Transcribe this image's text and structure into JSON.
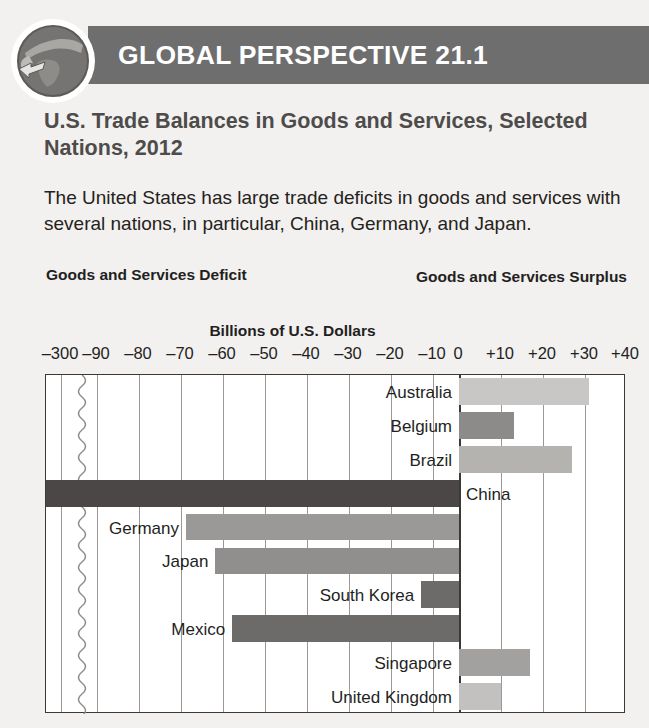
{
  "banner": {
    "title": "GLOBAL PERSPECTIVE 21.1",
    "icon": "globe-arrow-icon",
    "bar_color": "#6e6e6e"
  },
  "headline": "U.S. Trade Balances in Goods and Services, Selected Nations, 2012",
  "blurb": "The United States has large trade deficits in goods and services with several nations, in particular, China, Germany, and Japan.",
  "captions": {
    "deficit": "Goods and Services Deficit",
    "surplus": "Goods and Services Surplus"
  },
  "chart_data": {
    "type": "bar",
    "orientation": "horizontal",
    "title": "U.S. Trade Balances in Goods and Services, Selected Nations, 2012",
    "xlabel": "Billions of U.S. Dollars",
    "ylabel": "",
    "grid": true,
    "legend": false,
    "axis_break": {
      "between": [
        -300,
        -90
      ],
      "marker": "squiggle"
    },
    "xlim": [
      -300,
      40
    ],
    "tick_labels": [
      "–300",
      "–90",
      "–80",
      "–70",
      "–60",
      "–50",
      "–40",
      "–30",
      "–20",
      "–10",
      "0",
      "+10",
      "+20",
      "+30",
      "+40"
    ],
    "tick_values": [
      -300,
      -90,
      -80,
      -70,
      -60,
      -50,
      -40,
      -30,
      -20,
      -10,
      0,
      10,
      20,
      30,
      40
    ],
    "tick_px": [
      60,
      96,
      138,
      180,
      222,
      264,
      306,
      348,
      390,
      432,
      458,
      500,
      542,
      584,
      625
    ],
    "categories": [
      "Australia",
      "Belgium",
      "Brazil",
      "China",
      "Germany",
      "Japan",
      "South Korea",
      "Mexico",
      "Singapore",
      "United Kingdom"
    ],
    "values": [
      31,
      13,
      27,
      -315,
      -65,
      -58,
      -9,
      -54,
      17,
      10
    ],
    "bars": [
      {
        "label": "Australia",
        "value": 31,
        "color": "#c8c7c5",
        "label_side": "left",
        "clipped": false
      },
      {
        "label": "Belgium",
        "value": 13,
        "color": "#8d8b89",
        "label_side": "left",
        "clipped": false
      },
      {
        "label": "Brazil",
        "value": 27,
        "color": "#b4b3b0",
        "label_side": "left",
        "clipped": false
      },
      {
        "label": "China",
        "value": -315,
        "color": "#4a4746",
        "label_side": "right",
        "clipped": true
      },
      {
        "label": "Germany",
        "value": -65,
        "color": "#9b9997",
        "label_side": "left",
        "clipped": false
      },
      {
        "label": "Japan",
        "value": -58,
        "color": "#918f8d",
        "label_side": "left",
        "clipped": false
      },
      {
        "label": "South Korea",
        "value": -9,
        "color": "#6d6b69",
        "label_side": "left",
        "clipped": false
      },
      {
        "label": "Mexico",
        "value": -54,
        "color": "#6d6b69",
        "label_side": "left",
        "clipped": false
      },
      {
        "label": "Singapore",
        "value": 17,
        "color": "#a3a19f",
        "label_side": "left",
        "clipped": false
      },
      {
        "label": "United Kingdom",
        "value": 10,
        "color": "#c2c1bf",
        "label_side": "left",
        "clipped": false
      }
    ]
  }
}
